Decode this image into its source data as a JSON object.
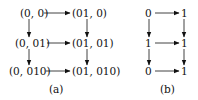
{
  "panel_a": {
    "caption": "(a)",
    "nodes": {
      "r0c0": "(0, 0)",
      "r0c1": "(01, 0)",
      "r1c0": "(0, 01)",
      "r1c1": "(01, 01)",
      "r2c0": "(0, 010)",
      "r2c1": "(01, 010)"
    }
  },
  "panel_b": {
    "caption": "(b)",
    "nodes": {
      "r0c0": "0",
      "r0c1": "1",
      "r1c0": "1",
      "r1c1": "1",
      "r2c0": "0",
      "r2c1": "1"
    }
  },
  "colors": {
    "line": "#111111",
    "background": "#ffffff"
  }
}
